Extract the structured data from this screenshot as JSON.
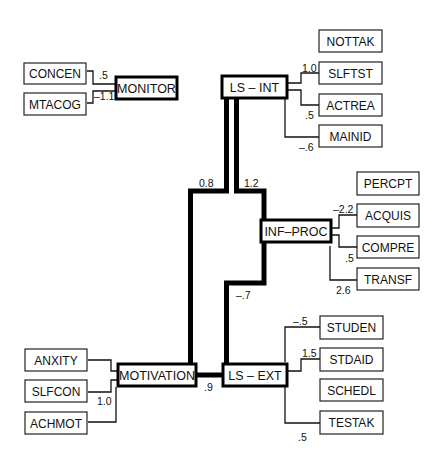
{
  "diagram": {
    "type": "structural-equation-path-diagram",
    "latent": {
      "monitor": "MONITOR",
      "ls_int": "LS – INT",
      "inf_proc": "INF–PROC",
      "motivation": "MOTIVATION",
      "ls_ext": "LS – EXT"
    },
    "indicators": {
      "monitor": [
        "CONCEN",
        "MTACOG"
      ],
      "ls_int": [
        "NOTTAK",
        "SLFTST",
        "ACTREA",
        "MAINID"
      ],
      "inf_proc": [
        "PERCPT",
        "ACQUIS",
        "COMPRE",
        "TRANSF"
      ],
      "motivation": [
        "ANXITY",
        "SLFCON",
        "ACHMOT"
      ],
      "ls_ext": [
        "STUDEN",
        "STDAID",
        "SCHEDL",
        "TESTAK"
      ]
    },
    "loadings": {
      "concen_monitor": ".5",
      "mtacog_monitor": "–1.1",
      "ls_int_slftst": "1.0",
      "ls_int_actrea": ".5",
      "ls_int_mainid": "–.6",
      "inf_proc_acquis": "–2.2",
      "inf_proc_compre": ".5",
      "inf_proc_transf": "2.6",
      "slfcon_motivation": "1.0",
      "ls_ext_studen": "–.5",
      "ls_ext_stdaid": "1.5",
      "ls_ext_testak": ".5"
    },
    "structural_paths": {
      "ls_int_motivation": "0.8",
      "ls_int_inf_proc": "1.2",
      "inf_proc_ls_ext": "–.7",
      "motivation_ls_ext": ".9"
    }
  }
}
